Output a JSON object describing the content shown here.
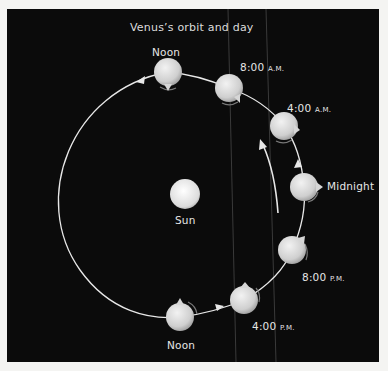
{
  "title": "Venus’s orbit and day",
  "sun": {
    "label": "Sun"
  },
  "positions": [
    {
      "id": "noon-top",
      "time": "Noon",
      "suffix": ""
    },
    {
      "id": "8am",
      "time": "8:00",
      "suffix": "A.M."
    },
    {
      "id": "4am",
      "time": "4:00",
      "suffix": "A.M."
    },
    {
      "id": "midnight",
      "time": "Midnight",
      "suffix": ""
    },
    {
      "id": "8pm",
      "time": "8:00",
      "suffix": "P.M."
    },
    {
      "id": "4pm",
      "time": "4:00",
      "suffix": "P.M."
    },
    {
      "id": "noon-bottom",
      "time": "Noon",
      "suffix": ""
    }
  ],
  "colors": {
    "background": "#0b0b0b",
    "frame": "#f4f4f2",
    "orbit": "#e8e8e8",
    "planet": "#d8d8d8",
    "text": "#e6e6e6"
  }
}
